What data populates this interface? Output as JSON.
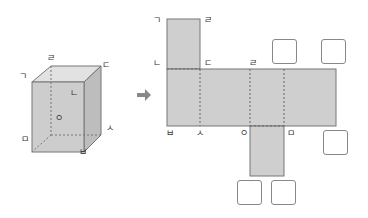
{
  "cube": {
    "labels": {
      "g": "ㄱ",
      "r": "ㄹ",
      "d": "ㄷ",
      "n": "ㄴ",
      "o": "ㅇ",
      "m": "ㅁ",
      "s": "ㅅ",
      "b": "ㅂ"
    },
    "face_color": "#c8c8c8"
  },
  "arrow": {
    "color": "#888888"
  },
  "net": {
    "labels": {
      "top_left": "ㄱ",
      "top_right": "ㄹ",
      "mid_left": "ㄴ",
      "mid_d": "ㄷ",
      "mid_r": "ㄹ",
      "bot_b": "ㅂ",
      "bot_s": "ㅅ",
      "bot_o": "ㅇ",
      "bot_m": "ㅁ"
    },
    "fill_color": "#cfcfcf",
    "answer_boxes": 5
  }
}
